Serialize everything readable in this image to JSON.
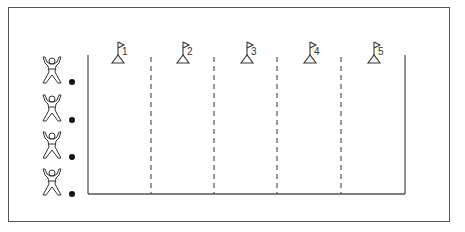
{
  "diagram": {
    "type": "relay-race-lanes",
    "colors": {
      "line": "#555555",
      "ink": "#222222",
      "background": "#ffffff"
    },
    "lanes": [
      {
        "number": "1",
        "flag_x": 118
      },
      {
        "number": "2",
        "flag_x": 183
      },
      {
        "number": "3",
        "flag_x": 247
      },
      {
        "number": "4",
        "flag_x": 310
      },
      {
        "number": "5",
        "flag_x": 374
      }
    ],
    "dividers": {
      "style": "dashed",
      "x": [
        151,
        214,
        277,
        341
      ]
    },
    "court": {
      "left": 88,
      "right": 405,
      "top": 55,
      "bottom": 194
    },
    "players": [
      {
        "id": "player-1",
        "figure_y": 58,
        "ball_y": 82
      },
      {
        "id": "player-2",
        "figure_y": 96,
        "ball_y": 120
      },
      {
        "id": "player-3",
        "figure_y": 133,
        "ball_y": 157
      },
      {
        "id": "player-4",
        "figure_y": 170,
        "ball_y": 194
      }
    ]
  }
}
